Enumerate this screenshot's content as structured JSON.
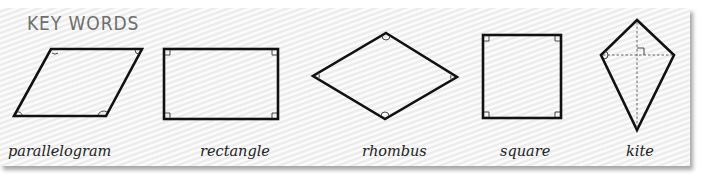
{
  "panel": {
    "title": "KEY WORDS",
    "background_color": "#f1f1f1",
    "title_color": "#6e6e6e"
  },
  "shapes": [
    {
      "name": "parallelogram",
      "label": "parallelogram"
    },
    {
      "name": "rectangle",
      "label": "rectangle"
    },
    {
      "name": "rhombus",
      "label": "rhombus"
    },
    {
      "name": "square",
      "label": "square"
    },
    {
      "name": "kite",
      "label": "kite"
    }
  ]
}
